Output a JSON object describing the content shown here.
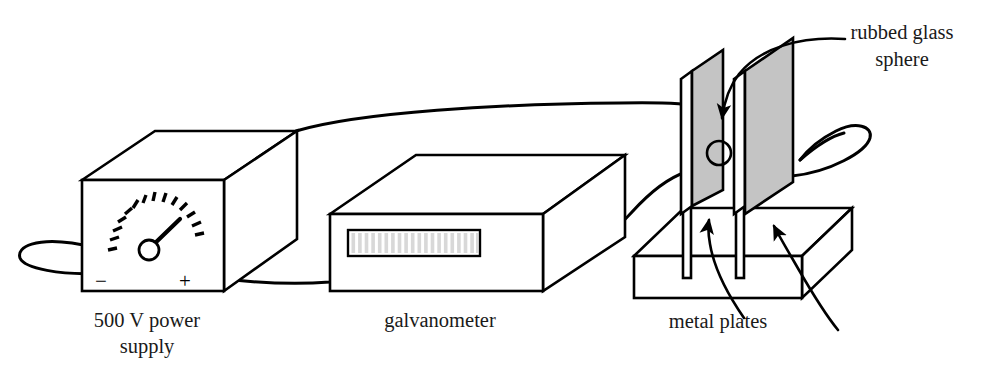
{
  "figure": {
    "background_color": "#ffffff",
    "line_color": "#000000",
    "plate_fill_color": "#c4c4c4",
    "body_fill_color": "#ffffff"
  },
  "labels": {
    "power_supply_line1": "500 V power",
    "power_supply_line2": "supply",
    "galvanometer": "galvanometer",
    "metal_plates": "metal plates",
    "rubbed_glass_line1": "rubbed glass",
    "rubbed_glass_line2": "sphere"
  },
  "power_supply": {
    "terminal_negative": "−",
    "terminal_positive": "+",
    "meter_tick_count": 13,
    "meter_needle_direction": "upper-right",
    "meter_name": "analog voltmeter dial"
  },
  "galvanometer": {
    "display_bar_count": 20,
    "display_name": "scale strip"
  },
  "plates": {
    "count": 2,
    "fill": "#c4c4c4",
    "base_name": "insulating stand block",
    "sphere_name": "rubbed glass sphere"
  },
  "wires": [
    {
      "name": "negative-terminal-loop",
      "from": "power supply − terminal",
      "to": "free loop at left"
    },
    {
      "name": "positive-terminal-to-galvanometer",
      "from": "power supply + terminal",
      "to": "galvanometer left side"
    },
    {
      "name": "power-supply-top-to-plate",
      "from": "power supply top rear",
      "to": "first metal plate"
    },
    {
      "name": "galvanometer-to-plate",
      "from": "galvanometer right side",
      "to": "second metal plate"
    },
    {
      "name": "plate-right-loop",
      "from": "second metal plate",
      "to": "free loop at right"
    }
  ],
  "arrows": [
    {
      "name": "sphere-arrow",
      "points_to": "rubbed glass sphere"
    },
    {
      "name": "plate-arrow-left",
      "points_to": "first metal plate"
    },
    {
      "name": "plate-arrow-right",
      "points_to": "second metal plate"
    }
  ]
}
